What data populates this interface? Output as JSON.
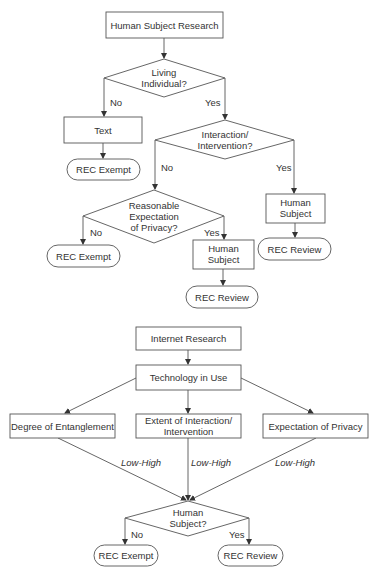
{
  "diagram1": {
    "nodes": {
      "hsr": [
        "Human Subject Research"
      ],
      "living": [
        "Living",
        "Individual?"
      ],
      "text": [
        "Text"
      ],
      "exempt1": [
        "REC Exempt"
      ],
      "interaction": [
        "Interaction/",
        "Intervention?"
      ],
      "privacy": [
        "Reasonable",
        "Expectation",
        "of Privacy?"
      ],
      "exempt2": [
        "REC Exempt"
      ],
      "human2": [
        "Human",
        "Subject"
      ],
      "review2": [
        "REC Review"
      ],
      "human1": [
        "Human",
        "Subject"
      ],
      "review1": [
        "REC Review"
      ]
    },
    "labels": {
      "living_no": "No",
      "living_yes": "Yes",
      "interaction_no": "No",
      "interaction_yes": "Yes",
      "privacy_no": "No",
      "privacy_yes": "Yes"
    }
  },
  "diagram2": {
    "nodes": {
      "internet": [
        "Internet Research"
      ],
      "tech": [
        "Technology in Use"
      ],
      "degree": [
        "Degree of Entanglement"
      ],
      "extent": [
        "Extent of Interaction/",
        "Intervention"
      ],
      "expectation": [
        "Expectation of Privacy"
      ],
      "human": [
        "Human",
        "Subject?"
      ],
      "exempt": [
        "REC Exempt"
      ],
      "review": [
        "REC Review"
      ]
    },
    "labels": {
      "degree_edge": "Low-High",
      "extent_edge": "Low-High",
      "expectation_edge": "Low-High",
      "human_no": "No",
      "human_yes": "Yes"
    }
  }
}
